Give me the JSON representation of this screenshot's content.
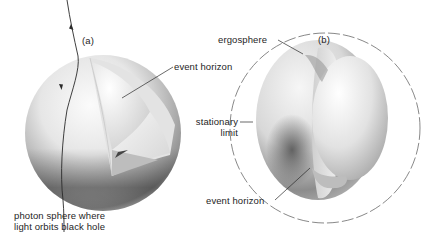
{
  "figure": {
    "panels": [
      {
        "id": "a",
        "tag": "(a)",
        "labels": {
          "event_horizon": "event horizon",
          "photon_sphere_line1": "photon sphere where",
          "photon_sphere_line2": "light orbits black hole"
        }
      },
      {
        "id": "b",
        "tag": "(b)",
        "labels": {
          "ergosphere": "ergosphere",
          "stationary_limit_line1": "stationary",
          "stationary_limit_line2": "limit",
          "event_horizon": "event horizon"
        }
      }
    ],
    "colors": {
      "background": "#ffffff",
      "ink": "#1e1e1e",
      "sphere_light": "#f4f4f4",
      "sphere_mid": "#cfcfcf",
      "sphere_dark": "#6a6a6a"
    }
  }
}
